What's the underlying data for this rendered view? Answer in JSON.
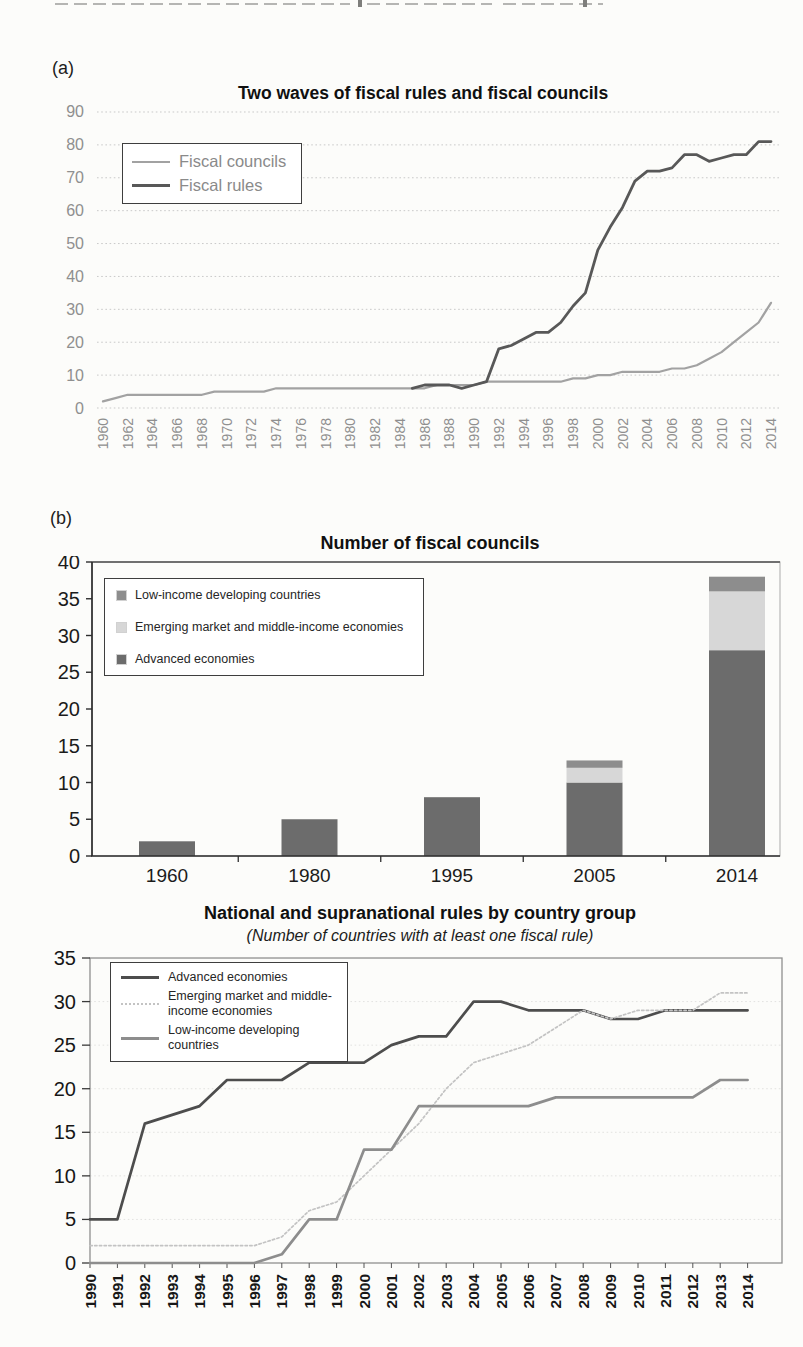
{
  "page": {
    "panel_tags": {
      "a": "(a)",
      "b": "(b)"
    }
  },
  "chart_data": [
    {
      "id": "two-waves",
      "type": "line",
      "title": "Two waves of fiscal rules and fiscal councils",
      "x_start": 1960,
      "x_end": 2014,
      "x_label_step": 2,
      "ylim": [
        0,
        90
      ],
      "ytick_step": 10,
      "grid": "dotted horizontal",
      "legend_position": "top-left",
      "series": [
        {
          "name": "Fiscal councils",
          "color": "#a2a2a2",
          "line_style": "solid",
          "x_start": 1960,
          "values": [
            2,
            3,
            4,
            4,
            4,
            4,
            4,
            4,
            4,
            5,
            5,
            5,
            5,
            5,
            6,
            6,
            6,
            6,
            6,
            6,
            6,
            6,
            6,
            6,
            6,
            6,
            6,
            7,
            7,
            7,
            7,
            8,
            8,
            8,
            8,
            8,
            8,
            8,
            9,
            9,
            10,
            10,
            11,
            11,
            11,
            11,
            12,
            12,
            13,
            15,
            17,
            20,
            23,
            26,
            32
          ]
        },
        {
          "name": "Fiscal rules",
          "color": "#585858",
          "line_style": "solid",
          "x_start": 1985,
          "values": [
            6,
            7,
            7,
            7,
            6,
            7,
            8,
            18,
            19,
            21,
            23,
            23,
            26,
            31,
            35,
            48,
            55,
            61,
            69,
            72,
            72,
            73,
            77,
            77,
            75,
            76,
            77,
            77,
            81,
            81
          ]
        }
      ]
    },
    {
      "id": "fiscal-councils-count",
      "type": "bar",
      "title": "Number of fiscal councils",
      "categories": [
        "1960",
        "1980",
        "1995",
        "2005",
        "2014"
      ],
      "ylim": [
        0,
        40
      ],
      "ytick_step": 5,
      "stacked": true,
      "legend_position": "top-left",
      "series": [
        {
          "name": "Advanced economies",
          "color": "#6c6c6c",
          "values": [
            2,
            5,
            8,
            10,
            28
          ]
        },
        {
          "name": "Emerging market and middle-income economies",
          "color": "#d7d7d7",
          "values": [
            0,
            0,
            0,
            2,
            8
          ]
        },
        {
          "name": "Low-income developing countries",
          "color": "#8d8d8d",
          "values": [
            0,
            0,
            0,
            1,
            2
          ]
        }
      ],
      "totals": [
        2,
        5,
        8,
        13,
        38
      ]
    },
    {
      "id": "rules-by-country-group",
      "type": "line",
      "title": "National and supranational rules by country group",
      "subtitle": "(Number of countries with at least one fiscal rule)",
      "x_start": 1990,
      "x_end": 2014,
      "x_label_step": 1,
      "ylim": [
        0,
        35
      ],
      "ytick_step": 5,
      "legend_position": "top-left",
      "series": [
        {
          "name": "Advanced economies",
          "color": "#4d4d4d",
          "line_style": "solid",
          "x_start": 1990,
          "values": [
            5,
            5,
            16,
            17,
            18,
            21,
            21,
            21,
            23,
            23,
            23,
            25,
            26,
            26,
            30,
            30,
            29,
            29,
            29,
            28,
            28,
            29,
            29,
            29,
            29
          ]
        },
        {
          "name": "Emerging market and middle-income economies",
          "color": "#c3c3c3",
          "line_style": "dotted",
          "x_start": 1990,
          "values": [
            2,
            2,
            2,
            2,
            2,
            2,
            2,
            3,
            6,
            7,
            10,
            13,
            16,
            20,
            23,
            24,
            25,
            27,
            29,
            28,
            29,
            29,
            29,
            31,
            31
          ]
        },
        {
          "name": "Low-income developing countries",
          "color": "#8d8d8d",
          "line_style": "solid",
          "x_start": 1990,
          "values": [
            0,
            0,
            0,
            0,
            0,
            0,
            0,
            1,
            5,
            5,
            13,
            13,
            18,
            18,
            18,
            18,
            18,
            19,
            19,
            19,
            19,
            19,
            19,
            21,
            21
          ]
        }
      ]
    }
  ]
}
